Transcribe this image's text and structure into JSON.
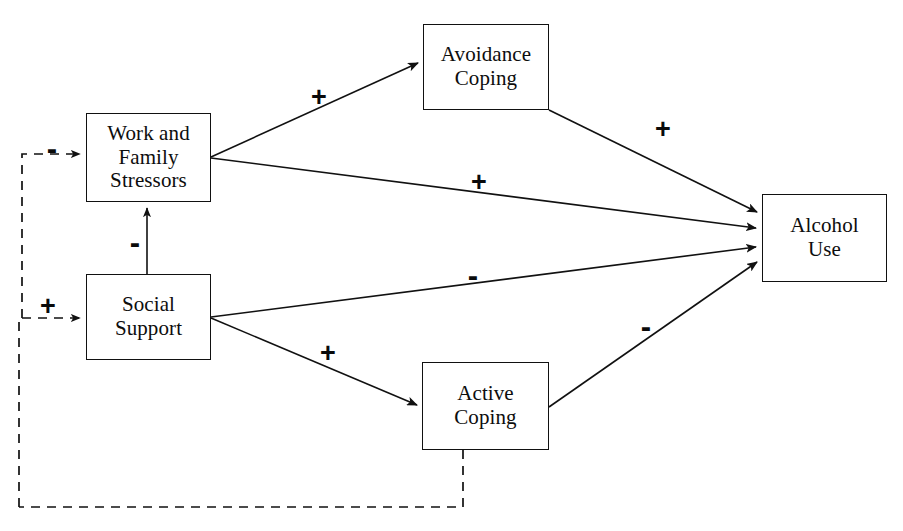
{
  "diagram": {
    "type": "path-model",
    "background_color": "#ffffff",
    "line_color": "#111111",
    "nodes": [
      {
        "id": "work-family-stressors",
        "label": "Work and\nFamily\nStressors",
        "x": 86,
        "y": 113,
        "w": 125,
        "h": 89
      },
      {
        "id": "social-support",
        "label": "Social\nSupport",
        "x": 86,
        "y": 274,
        "w": 125,
        "h": 86
      },
      {
        "id": "avoidance-coping",
        "label": "Avoidance\nCoping",
        "x": 423,
        "y": 24,
        "w": 126,
        "h": 86
      },
      {
        "id": "active-coping",
        "label": "Active\nCoping",
        "x": 422,
        "y": 362,
        "w": 127,
        "h": 88
      },
      {
        "id": "alcohol-use",
        "label": "Alcohol\nUse",
        "x": 762,
        "y": 194,
        "w": 125,
        "h": 88
      }
    ],
    "edges": [
      {
        "id": "stressors-to-avoidance",
        "from": "work-family-stressors",
        "to": "avoidance-coping",
        "sign": "+",
        "style": "solid"
      },
      {
        "id": "stressors-to-alcohol",
        "from": "work-family-stressors",
        "to": "alcohol-use",
        "sign": "+",
        "style": "solid"
      },
      {
        "id": "avoidance-to-alcohol",
        "from": "avoidance-coping",
        "to": "alcohol-use",
        "sign": "+",
        "style": "solid"
      },
      {
        "id": "support-to-alcohol",
        "from": "social-support",
        "to": "alcohol-use",
        "sign": "-",
        "style": "solid"
      },
      {
        "id": "support-to-active",
        "from": "social-support",
        "to": "active-coping",
        "sign": "+",
        "style": "solid"
      },
      {
        "id": "active-to-alcohol",
        "from": "active-coping",
        "to": "alcohol-use",
        "sign": "-",
        "style": "solid"
      },
      {
        "id": "support-to-stressors",
        "from": "social-support",
        "to": "work-family-stressors",
        "sign": "-",
        "style": "solid"
      },
      {
        "id": "feedback-to-stressors",
        "from": "feedback-loop",
        "to": "work-family-stressors",
        "sign": "-",
        "style": "dashed"
      },
      {
        "id": "feedback-to-support",
        "from": "feedback-loop",
        "to": "social-support",
        "sign": "+",
        "style": "dashed"
      },
      {
        "id": "active-coping-feedback",
        "from": "active-coping",
        "to": "feedback-loop",
        "sign": "",
        "style": "dashed"
      }
    ],
    "signs": [
      {
        "id": "sign-feedback-stressors",
        "text": "-",
        "x": 52,
        "y": 148
      },
      {
        "id": "sign-support-stressors",
        "text": "-",
        "x": 135,
        "y": 242
      },
      {
        "id": "sign-feedback-support",
        "text": "+",
        "x": 48,
        "y": 306
      },
      {
        "id": "sign-stressors-avoidance",
        "text": "+",
        "x": 319,
        "y": 97
      },
      {
        "id": "sign-stressors-alcohol",
        "text": "+",
        "x": 479,
        "y": 182
      },
      {
        "id": "sign-avoidance-alcohol",
        "text": "+",
        "x": 663,
        "y": 129
      },
      {
        "id": "sign-support-alcohol",
        "text": "-",
        "x": 473,
        "y": 275
      },
      {
        "id": "sign-active-alcohol",
        "text": "-",
        "x": 646,
        "y": 326
      },
      {
        "id": "sign-support-active",
        "text": "+",
        "x": 328,
        "y": 353
      }
    ]
  }
}
